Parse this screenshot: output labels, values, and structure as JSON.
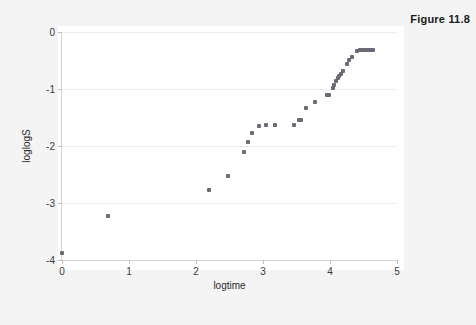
{
  "figure": {
    "caption": "Figure 11.8"
  },
  "chart_data": {
    "type": "scatter",
    "title": "",
    "xlabel": "logtime",
    "ylabel": "loglogS",
    "xlim": [
      0,
      5
    ],
    "ylim": [
      -4,
      0
    ],
    "xticks": [
      "0",
      "1",
      "2",
      "3",
      "4",
      "5"
    ],
    "xtick_values": [
      0,
      1,
      2,
      3,
      4,
      5
    ],
    "yticks": [
      "0",
      "-1",
      "-2",
      "-3",
      "-4"
    ],
    "ytick_values": [
      0,
      -1,
      -2,
      -3,
      -4
    ],
    "grid": true,
    "legend": null,
    "marker_color": "#6b6b78",
    "points": [
      {
        "x": 0.0,
        "y": -3.88
      },
      {
        "x": 0.69,
        "y": -3.23
      },
      {
        "x": 2.2,
        "y": -2.78
      },
      {
        "x": 2.48,
        "y": -2.52
      },
      {
        "x": 2.71,
        "y": -2.1
      },
      {
        "x": 2.77,
        "y": -1.93
      },
      {
        "x": 2.83,
        "y": -1.78
      },
      {
        "x": 2.94,
        "y": -1.65
      },
      {
        "x": 3.04,
        "y": -1.64
      },
      {
        "x": 3.18,
        "y": -1.64
      },
      {
        "x": 3.47,
        "y": -1.64
      },
      {
        "x": 3.53,
        "y": -1.55
      },
      {
        "x": 3.56,
        "y": -1.55
      },
      {
        "x": 3.64,
        "y": -1.34
      },
      {
        "x": 3.78,
        "y": -1.23
      },
      {
        "x": 3.95,
        "y": -1.11
      },
      {
        "x": 3.99,
        "y": -1.1
      },
      {
        "x": 4.04,
        "y": -0.98
      },
      {
        "x": 4.06,
        "y": -0.93
      },
      {
        "x": 4.09,
        "y": -0.86
      },
      {
        "x": 4.12,
        "y": -0.81
      },
      {
        "x": 4.14,
        "y": -0.78
      },
      {
        "x": 4.17,
        "y": -0.73
      },
      {
        "x": 4.2,
        "y": -0.68
      },
      {
        "x": 4.25,
        "y": -0.57
      },
      {
        "x": 4.28,
        "y": -0.49
      },
      {
        "x": 4.33,
        "y": -0.43
      },
      {
        "x": 4.41,
        "y": -0.34
      },
      {
        "x": 4.45,
        "y": -0.31
      },
      {
        "x": 4.49,
        "y": -0.31
      },
      {
        "x": 4.52,
        "y": -0.31
      },
      {
        "x": 4.55,
        "y": -0.31
      },
      {
        "x": 4.58,
        "y": -0.31
      },
      {
        "x": 4.61,
        "y": -0.31
      },
      {
        "x": 4.64,
        "y": -0.31
      }
    ]
  }
}
